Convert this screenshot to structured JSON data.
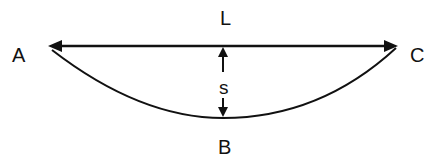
{
  "diagram": {
    "labels": {
      "a": "A",
      "b": "B",
      "c": "C",
      "l": "L",
      "s": "s"
    },
    "colors": {
      "stroke": "#111111",
      "background": "#ffffff"
    }
  }
}
